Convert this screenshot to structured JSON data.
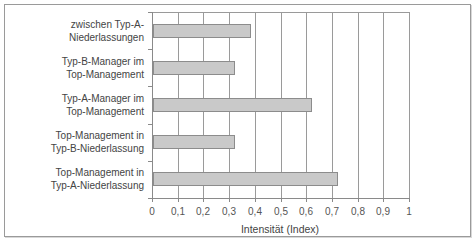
{
  "chart_data": {
    "type": "bar",
    "orientation": "horizontal",
    "title": "",
    "xlabel": "Intensität (Index)",
    "ylabel": "",
    "xlim": [
      0,
      1
    ],
    "xticks": [
      "0",
      "0,1",
      "0,2",
      "0,3",
      "0,4",
      "0,5",
      "0,6",
      "0,7",
      "0,8",
      "0,9",
      "1"
    ],
    "grid": "vertical",
    "legend": "none",
    "categories": [
      "zwischen Typ-A-Niederlassungen",
      "Typ-B-Manager im Top-Management",
      "Typ-A-Manager im Top-Management",
      "Top-Management in Typ-B-Niederlassung",
      "Top-Management in Typ-A-Niederlassung"
    ],
    "values": [
      0.38,
      0.32,
      0.62,
      0.32,
      0.72
    ],
    "colors": {
      "bar_fill": "#c9c9c9",
      "bar_border": "#8c8c8c",
      "grid": "#9a9a9a"
    }
  },
  "labels": {
    "cat0": [
      "zwischen Typ-A-",
      "Niederlassungen"
    ],
    "cat1": [
      "Typ-B-Manager im",
      "Top-Management"
    ],
    "cat2": [
      "Typ-A-Manager im",
      "Top-Management"
    ],
    "cat3": [
      "Top-Management in",
      "Typ-B-Niederlassung"
    ],
    "cat4": [
      "Top-Management in",
      "Typ-A-Niederlassung"
    ]
  }
}
